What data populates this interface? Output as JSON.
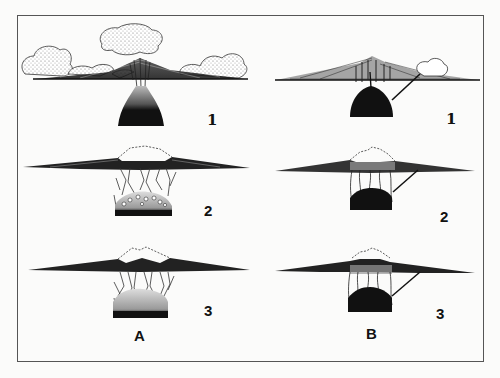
{
  "figure": {
    "columns": [
      {
        "id": "A",
        "label": "A",
        "stages": [
          {
            "number": "1",
            "description": "Stratovolcano erupting with ash clouds above a magma chamber"
          },
          {
            "number": "2",
            "description": "Summit collapse (dashed former profile) into fractured chamber with blocks"
          },
          {
            "number": "3",
            "description": "Caldera with fractured roof foundering into magma chamber"
          }
        ]
      },
      {
        "id": "B",
        "label": "B",
        "stages": [
          {
            "number": "1",
            "description": "Volcano with flank vent fed by inclined dike from magma chamber"
          },
          {
            "number": "2",
            "description": "Summit collapse (dashed former profile) with ring fractures over chamber"
          },
          {
            "number": "3",
            "description": "Caldera subsidence with ring faults and flank dike"
          }
        ]
      }
    ],
    "colors": {
      "ink": "#111111",
      "paper": "#fbfbfa",
      "frame": "#555555",
      "stipple": "#9a9a9a"
    }
  }
}
